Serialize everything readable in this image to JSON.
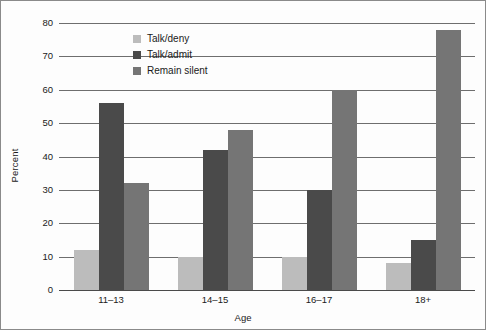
{
  "chart_data": {
    "type": "bar",
    "title": "",
    "xlabel": "Age",
    "ylabel": "Percent",
    "categories": [
      "11–13",
      "14–15",
      "16–17",
      "18+"
    ],
    "series": [
      {
        "name": "Talk/deny",
        "color": "#bcbcbc",
        "values": [
          12,
          10,
          10,
          8
        ]
      },
      {
        "name": "Talk/admit",
        "color": "#4a4a4a",
        "values": [
          56,
          42,
          30,
          15
        ]
      },
      {
        "name": "Remain silent",
        "color": "#757575",
        "values": [
          32,
          48,
          60,
          78
        ]
      }
    ],
    "ylim": [
      0,
      80
    ],
    "yticks": [
      0,
      10,
      20,
      30,
      40,
      50,
      60,
      70,
      80
    ],
    "ytick_labels": [
      "0",
      "10",
      "20",
      "30",
      "40",
      "50",
      "60",
      "70",
      "80"
    ],
    "grid": "horizontal",
    "legend_position": "upper-left-inside",
    "bar_grouping": "clustered",
    "colors": {
      "talk_deny": "#bcbcbc",
      "talk_admit": "#4a4a4a",
      "remain_silent": "#757575",
      "gridline": "#6e6e6e",
      "axis": "#4a4a4a",
      "text": "#1a1a1a",
      "background": "#fdfdfd",
      "border": "#8a8a8a"
    }
  }
}
